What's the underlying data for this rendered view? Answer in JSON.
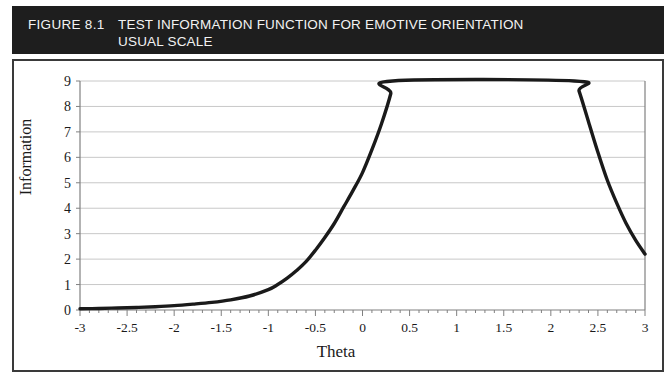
{
  "figure": {
    "number_label": "FIGURE 8.1",
    "title": "TEST INFORMATION FUNCTION FOR EMOTIVE ORIENTATION\nUSUAL SCALE",
    "header_bg": "#1e1e1e",
    "header_fg": "#f2f2f2",
    "frame_color": "#3a3a3a"
  },
  "chart_data": {
    "type": "line",
    "title": "TEST INFORMATION FUNCTION FOR EMOTIVE ORIENTATION USUAL SCALE",
    "xlabel": "Theta",
    "ylabel": "Information",
    "xlim": [
      -3,
      3
    ],
    "ylim": [
      0,
      9
    ],
    "grid": "horizontal",
    "legend": "none",
    "line_color": "#1a1a1a",
    "grid_color": "#c8c8c8",
    "axis_color": "#808080",
    "xticks": [
      -3,
      -2.5,
      -2,
      -1.5,
      -1,
      -0.5,
      0,
      0.5,
      1,
      1.5,
      2,
      2.5,
      3
    ],
    "xtick_labels": [
      "-3",
      "-2.5",
      "-2",
      "-1.5",
      "-1",
      "-0.5",
      "0",
      "0.5",
      "1",
      "1.5",
      "2",
      "2.5",
      "3"
    ],
    "xminor_step": 0.1,
    "yticks": [
      0,
      1,
      2,
      3,
      4,
      5,
      6,
      7,
      8,
      9
    ],
    "ytick_labels": [
      "0",
      "1",
      "2",
      "3",
      "4",
      "5",
      "6",
      "7",
      "8",
      "9"
    ],
    "series": [
      {
        "name": "Test Information Function",
        "clipped_above": 9,
        "x": [
          -3,
          -2.8,
          -2.6,
          -2.4,
          -2.2,
          -2,
          -1.8,
          -1.6,
          -1.4,
          -1.2,
          -1,
          -0.9,
          -0.8,
          -0.7,
          -0.6,
          -0.5,
          -0.4,
          -0.3,
          -0.2,
          -0.1,
          0,
          0.1,
          0.2,
          0.3,
          0.32,
          2.25,
          2.3,
          2.4,
          2.5,
          2.6,
          2.7,
          2.8,
          2.9,
          3
        ],
        "values": [
          0.05,
          0.06,
          0.08,
          0.1,
          0.13,
          0.17,
          0.23,
          0.3,
          0.4,
          0.55,
          0.8,
          1.0,
          1.25,
          1.55,
          1.9,
          2.35,
          2.85,
          3.4,
          4.05,
          4.7,
          5.4,
          6.3,
          7.3,
          8.5,
          9.0,
          9.0,
          8.6,
          7.4,
          6.2,
          5.1,
          4.2,
          3.4,
          2.75,
          2.2
        ]
      }
    ]
  }
}
